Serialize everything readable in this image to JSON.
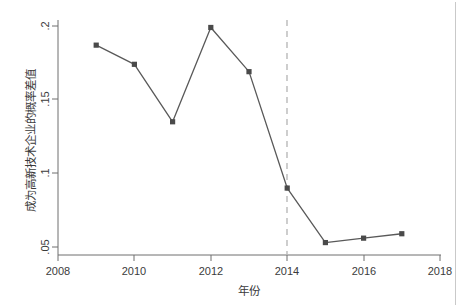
{
  "chart_data": {
    "type": "line",
    "title": "",
    "subtitle": "",
    "xlabel": "年份",
    "ylabel": "成为高新技术企业的概率差值",
    "x": [
      2009,
      2010,
      2011,
      2012,
      2013,
      2014,
      2015,
      2016,
      2017
    ],
    "values": [
      0.187,
      0.174,
      0.135,
      0.199,
      0.169,
      0.09,
      0.053,
      0.056,
      0.059
    ],
    "series": [
      {
        "name": "成为高新技术企业的概率差值",
        "x": [
          2009,
          2010,
          2011,
          2012,
          2013,
          2014,
          2015,
          2016,
          2017
        ],
        "values": [
          0.187,
          0.174,
          0.135,
          0.199,
          0.169,
          0.09,
          0.053,
          0.056,
          0.059
        ]
      }
    ],
    "xlim": [
      2008,
      2018
    ],
    "ylim": [
      0.05,
      0.2
    ],
    "xticks": [
      2008,
      2010,
      2012,
      2014,
      2016,
      2018
    ],
    "xtick_labels": [
      "2008",
      "2010",
      "2012",
      "2014",
      "2016",
      "2018"
    ],
    "yticks": [
      0.05,
      0.1,
      0.15,
      0.2
    ],
    "ytick_labels": [
      ".05",
      ".1",
      ".15",
      ".2"
    ],
    "grid": false,
    "legend": "none",
    "annotations": [
      {
        "type": "vertical-reference-line",
        "x": 2014,
        "style": "dashed",
        "color": "#b9b9b9"
      }
    ],
    "marker": "square",
    "line_color": "#595959",
    "marker_color": "#4a4a4a",
    "axis_color": "#6e6e6e"
  },
  "axes": {
    "x_title": "年份",
    "y_title": "成为高新技术企业的概率差值",
    "x_tick_labels": [
      "2008",
      "2010",
      "2012",
      "2014",
      "2016",
      "2018"
    ],
    "y_tick_labels": [
      ".05",
      ".1",
      ".15",
      ".2"
    ]
  },
  "colors": {
    "background": "#ffffff",
    "line": "#595959",
    "marker": "#4a4a4a",
    "axis": "#6e6e6e",
    "reference_line": "#b9b9b9",
    "frame_rule": "#c9c9c9"
  }
}
